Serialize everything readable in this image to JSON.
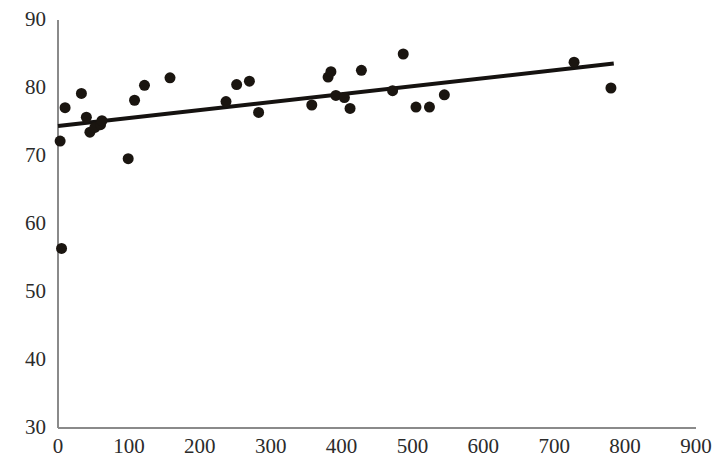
{
  "chart_data": {
    "type": "scatter",
    "title": "",
    "subtitle": "",
    "xlabel": "",
    "ylabel": "",
    "xlim": [
      0,
      900
    ],
    "ylim": [
      30,
      90
    ],
    "xticks": [
      0,
      100,
      200,
      300,
      400,
      500,
      600,
      700,
      800,
      900
    ],
    "yticks": [
      30,
      40,
      50,
      60,
      70,
      80,
      90
    ],
    "xtick_labels": [
      "0",
      "100",
      "200",
      "300",
      "400",
      "500",
      "600",
      "700",
      "800",
      "900"
    ],
    "ytick_labels": [
      "30",
      "40",
      "50",
      "60",
      "70",
      "80",
      "90"
    ],
    "grid": false,
    "legend": null,
    "legend_position": "none",
    "annotations": [],
    "series": [
      {
        "name": "observations",
        "type": "scatter",
        "marker": "circle",
        "marker_size": 11,
        "color": "#1a1510",
        "points": [
          {
            "x": 3,
            "y": 72.2
          },
          {
            "x": 5,
            "y": 56.4
          },
          {
            "x": 10,
            "y": 77.1
          },
          {
            "x": 33,
            "y": 79.2
          },
          {
            "x": 40,
            "y": 75.7
          },
          {
            "x": 45,
            "y": 73.5
          },
          {
            "x": 52,
            "y": 74.2
          },
          {
            "x": 60,
            "y": 74.6
          },
          {
            "x": 62,
            "y": 75.2
          },
          {
            "x": 99,
            "y": 69.6
          },
          {
            "x": 108,
            "y": 78.2
          },
          {
            "x": 122,
            "y": 80.4
          },
          {
            "x": 158,
            "y": 81.5
          },
          {
            "x": 237,
            "y": 78.0
          },
          {
            "x": 252,
            "y": 80.5
          },
          {
            "x": 270,
            "y": 81.0
          },
          {
            "x": 283,
            "y": 76.4
          },
          {
            "x": 358,
            "y": 77.5
          },
          {
            "x": 381,
            "y": 81.6
          },
          {
            "x": 385,
            "y": 82.4
          },
          {
            "x": 392,
            "y": 78.9
          },
          {
            "x": 404,
            "y": 78.6
          },
          {
            "x": 412,
            "y": 77.0
          },
          {
            "x": 428,
            "y": 82.6
          },
          {
            "x": 472,
            "y": 79.6
          },
          {
            "x": 487,
            "y": 85.0
          },
          {
            "x": 505,
            "y": 77.2
          },
          {
            "x": 524,
            "y": 77.2
          },
          {
            "x": 545,
            "y": 79.0
          },
          {
            "x": 728,
            "y": 83.8
          },
          {
            "x": 780,
            "y": 80.0
          }
        ]
      },
      {
        "name": "trendline",
        "type": "line",
        "color": "#151210",
        "line_width": 4,
        "x_start": 0,
        "y_start": 74.4,
        "x_end": 784,
        "y_end": 83.6
      }
    ],
    "axis_color": "#8a8a8a",
    "marker_color": "#1a1510",
    "trendline_color": "#151210"
  }
}
